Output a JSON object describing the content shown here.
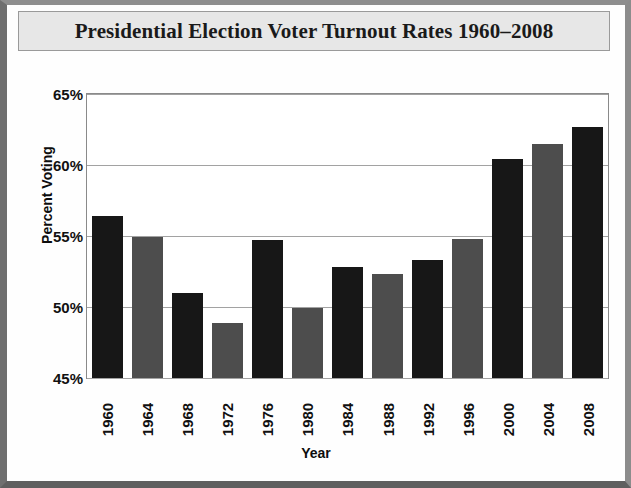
{
  "chart_data": {
    "type": "bar",
    "title": "Presidential Election Voter Turnout Rates 1960–2008",
    "xlabel": "Year",
    "ylabel": "Percent Voting",
    "categories": [
      "1960",
      "1964",
      "1968",
      "1972",
      "1976",
      "1980",
      "1984",
      "1988",
      "1992",
      "1996",
      "2000",
      "2004",
      "2008"
    ],
    "values": [
      56.4,
      54.9,
      51.0,
      48.9,
      54.7,
      49.9,
      52.8,
      52.3,
      53.3,
      54.8,
      60.4,
      61.5,
      62.7
    ],
    "ylim": [
      45,
      65
    ],
    "yticks": [
      "45%",
      "50%",
      "55%",
      "60%",
      "65%"
    ],
    "ytick_values": [
      45,
      50,
      55,
      60,
      65
    ],
    "grid": true,
    "legend": "none",
    "bar_colors": [
      "#171717",
      "#4d4d4d",
      "#171717",
      "#4d4d4d",
      "#171717",
      "#4d4d4d",
      "#171717",
      "#4d4d4d",
      "#171717",
      "#4d4d4d",
      "#171717",
      "#4d4d4d",
      "#171717"
    ]
  },
  "frame": {
    "title_band_color": "#e7e7e7",
    "border_color": "#8a8a8a",
    "gridline_color": "#a2a2a2",
    "plot_background": "#ffffff"
  }
}
